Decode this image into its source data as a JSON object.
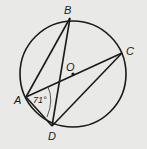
{
  "diagram": {
    "type": "circle-geometry",
    "circle": {
      "center_label": "O",
      "cx": 73,
      "cy": 74,
      "r": 53
    },
    "points": [
      {
        "label": "A",
        "x": 26,
        "y": 97
      },
      {
        "label": "B",
        "x": 70,
        "y": 18
      },
      {
        "label": "C",
        "x": 122,
        "y": 53
      },
      {
        "label": "D",
        "x": 52,
        "y": 126
      },
      {
        "label": "O",
        "x": 73,
        "y": 74
      }
    ],
    "segments": [
      "AB",
      "BD",
      "AC",
      "CD",
      "AD"
    ],
    "angle_marks": [
      {
        "vertex": "A",
        "between": [
          "C",
          "D"
        ],
        "value": "71°"
      }
    ],
    "labels": {
      "A": "A",
      "B": "B",
      "C": "C",
      "D": "D",
      "O": "O",
      "angle": "71°"
    },
    "colors": {
      "background": "#e9e9e7",
      "stroke": "#1a1a1a"
    }
  }
}
